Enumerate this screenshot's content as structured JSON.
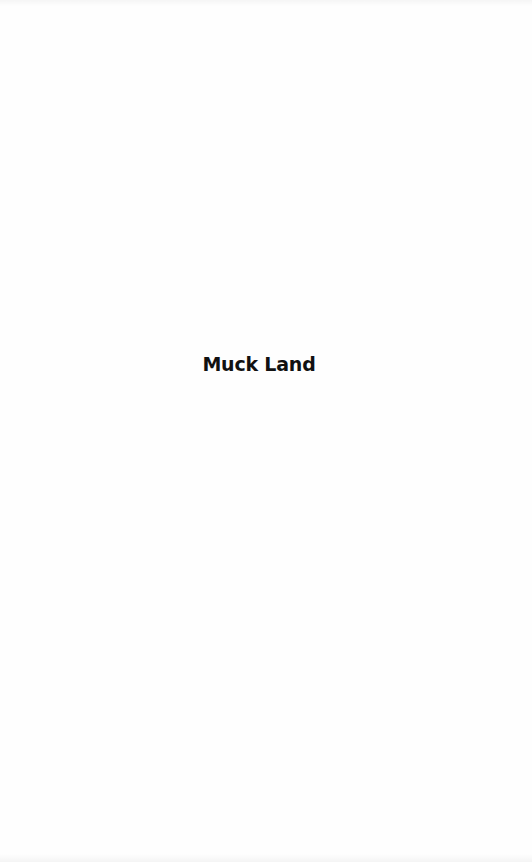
{
  "page": {
    "half_title": "Muck Land",
    "background_color": "#fefefe",
    "text_color": "#111111"
  }
}
